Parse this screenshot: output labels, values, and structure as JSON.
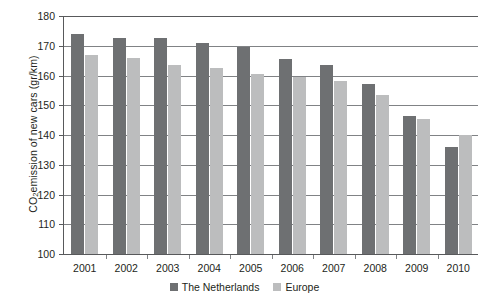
{
  "chart_data": {
    "type": "bar",
    "title": "",
    "xlabel": "",
    "ylabel": "CO2 emission of new cars (gr/km)",
    "ylabel_parts": {
      "pre": "CO",
      "sub": "2",
      "post": " emission of new cars (gr/km)"
    },
    "categories": [
      "2001",
      "2002",
      "2003",
      "2004",
      "2005",
      "2006",
      "2007",
      "2008",
      "2009",
      "2010"
    ],
    "series": [
      {
        "name": "The Netherlands",
        "color": "#6e7072",
        "values": [
          174,
          172.5,
          172.5,
          171,
          169.5,
          165.5,
          163.5,
          157,
          146.5,
          136
        ]
      },
      {
        "name": "Europe",
        "color": "#bcbdbe",
        "values": [
          167,
          166,
          163.5,
          162.5,
          160.5,
          159.5,
          158,
          153.5,
          145.5,
          140
        ]
      }
    ],
    "ylim": [
      100,
      180
    ],
    "ytick_labels": [
      "180",
      "170",
      "160",
      "150",
      "140",
      "130",
      "120",
      "110",
      "100"
    ],
    "ytick_values": [
      180,
      170,
      160,
      150,
      140,
      130,
      120,
      110,
      100
    ],
    "grid": true,
    "legend_position": "bottom-center"
  },
  "legend": {
    "items": [
      {
        "label": "The Netherlands",
        "swatch": "nl"
      },
      {
        "label": "Europe",
        "swatch": "eu"
      }
    ]
  },
  "colors": {
    "netherlands": "#6e7072",
    "europe": "#bcbdbe",
    "axis": "#58595b",
    "grid": "#808285",
    "text": "#231f20"
  }
}
